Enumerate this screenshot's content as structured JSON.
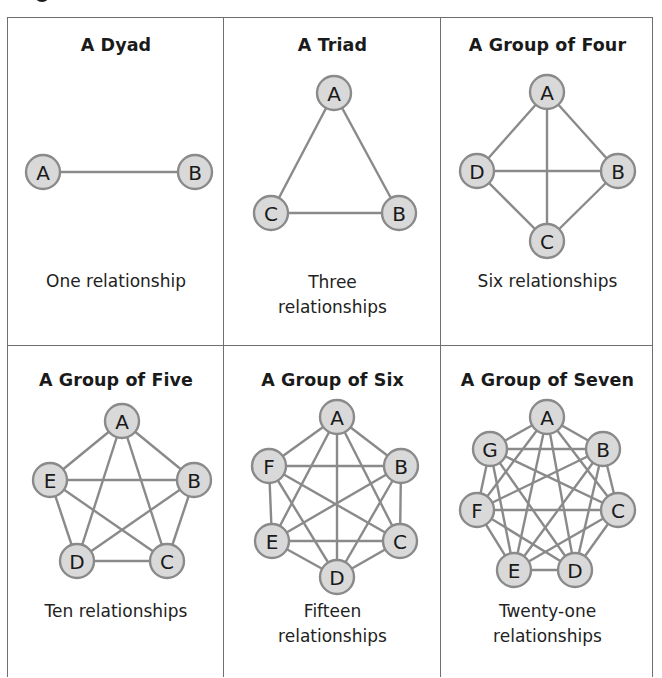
{
  "figure": {
    "colors": {
      "border": "#6f6f6f",
      "node_fill": "#d9d9d9",
      "node_stroke": "#8a8a8a",
      "edge": "#8a8a8a",
      "text": "#1a1a1a"
    },
    "cells": [
      {
        "title": "A Dyad",
        "caption_lines": [
          "One relationship"
        ],
        "node_count": 2,
        "relationship_count": 1,
        "nodes": [
          {
            "label": "A",
            "x": 43,
            "y": 172
          },
          {
            "label": "B",
            "x": 195,
            "y": 172
          }
        ]
      },
      {
        "title": "A Triad",
        "caption_lines": [
          "Three",
          "relationships"
        ],
        "node_count": 3,
        "relationship_count": 3,
        "nodes": [
          {
            "label": "A",
            "x": 334,
            "y": 93
          },
          {
            "label": "B",
            "x": 399,
            "y": 213
          },
          {
            "label": "C",
            "x": 271,
            "y": 213
          }
        ]
      },
      {
        "title": "A Group of Four",
        "caption_lines": [
          "Six relationships"
        ],
        "node_count": 4,
        "relationship_count": 6,
        "nodes": [
          {
            "label": "A",
            "x": 547,
            "y": 92
          },
          {
            "label": "B",
            "x": 618,
            "y": 171
          },
          {
            "label": "C",
            "x": 547,
            "y": 241
          },
          {
            "label": "D",
            "x": 477,
            "y": 171
          }
        ]
      },
      {
        "title": "A Group of Five",
        "caption_lines": [
          "Ten relationships"
        ],
        "node_count": 5,
        "relationship_count": 10,
        "nodes": [
          {
            "label": "A",
            "x": 122,
            "y": 421
          },
          {
            "label": "B",
            "x": 194,
            "y": 480
          },
          {
            "label": "C",
            "x": 167,
            "y": 561
          },
          {
            "label": "D",
            "x": 77,
            "y": 561
          },
          {
            "label": "E",
            "x": 50,
            "y": 480
          }
        ]
      },
      {
        "title": "A Group of Six",
        "caption_lines": [
          "Fifteen",
          "relationships"
        ],
        "node_count": 6,
        "relationship_count": 15,
        "nodes": [
          {
            "label": "A",
            "x": 337,
            "y": 417
          },
          {
            "label": "B",
            "x": 401,
            "y": 466
          },
          {
            "label": "C",
            "x": 400,
            "y": 541
          },
          {
            "label": "D",
            "x": 337,
            "y": 577
          },
          {
            "label": "E",
            "x": 272,
            "y": 541
          },
          {
            "label": "F",
            "x": 269,
            "y": 466
          }
        ]
      },
      {
        "title": "A Group of Seven",
        "caption_lines": [
          "Twenty-one",
          "relationships"
        ],
        "node_count": 7,
        "relationship_count": 21,
        "nodes": [
          {
            "label": "A",
            "x": 547,
            "y": 417
          },
          {
            "label": "B",
            "x": 603,
            "y": 449
          },
          {
            "label": "C",
            "x": 618,
            "y": 510
          },
          {
            "label": "D",
            "x": 575,
            "y": 570
          },
          {
            "label": "E",
            "x": 514,
            "y": 570
          },
          {
            "label": "F",
            "x": 477,
            "y": 510
          },
          {
            "label": "G",
            "x": 490,
            "y": 449
          }
        ]
      }
    ]
  }
}
